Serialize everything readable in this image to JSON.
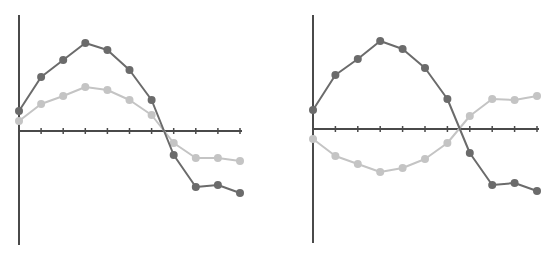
{
  "chart_data": [
    {
      "type": "line",
      "title": "",
      "xlabel": "",
      "ylabel": "",
      "x": [
        0,
        1,
        2,
        3,
        4,
        5,
        6,
        7,
        8,
        9,
        10
      ],
      "series": [
        {
          "name": "dark",
          "color": "#6b6b6b",
          "values": [
            2.0,
            5.4,
            7.1,
            8.8,
            8.1,
            6.1,
            3.1,
            -2.4,
            -5.6,
            -5.4,
            -6.2
          ]
        },
        {
          "name": "light",
          "color": "#c4c4c4",
          "values": [
            1.0,
            2.7,
            3.5,
            4.4,
            4.1,
            3.1,
            1.6,
            -1.2,
            -2.7,
            -2.7,
            -3.0
          ]
        }
      ],
      "ylim": [
        -11.4,
        11.6
      ],
      "grid": false,
      "legend": "none",
      "x_ticks": 11,
      "crossing_x": 6.6
    },
    {
      "type": "line",
      "title": "",
      "xlabel": "",
      "ylabel": "",
      "x": [
        0,
        1,
        2,
        3,
        4,
        5,
        6,
        7,
        8,
        9,
        10
      ],
      "series": [
        {
          "name": "dark",
          "color": "#6b6b6b",
          "values": [
            1.9,
            5.4,
            7.0,
            8.8,
            8.0,
            6.1,
            3.0,
            -2.4,
            -5.6,
            -5.4,
            -6.2
          ]
        },
        {
          "name": "light",
          "color": "#c4c4c4",
          "values": [
            -1.0,
            -2.7,
            -3.5,
            -4.3,
            -3.9,
            -3.0,
            -1.4,
            1.3,
            3.0,
            2.9,
            3.3
          ]
        }
      ],
      "ylim": [
        -11.4,
        11.4
      ],
      "grid": false,
      "legend": "none",
      "x_ticks": 11,
      "crossing_x": 6.5
    }
  ],
  "panels": [
    {
      "axis_x0": 19,
      "axis_x1": 242,
      "zero_y": 131,
      "y_top": 15,
      "y_bottom": 245,
      "step": 22.1,
      "unit_px": 10
    },
    {
      "axis_x0": 313,
      "axis_x1": 539,
      "zero_y": 129,
      "y_top": 15,
      "y_bottom": 243,
      "step": 22.4,
      "unit_px": 10
    }
  ],
  "style": {
    "axis_color": "#4a4a4a",
    "dark_color": "#6b6b6b",
    "light_color": "#c4c4c4",
    "marker_radius": 4
  }
}
